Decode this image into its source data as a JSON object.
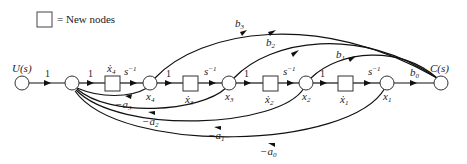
{
  "legend": {
    "symbol": "square-box",
    "text": "= New nodes"
  },
  "nodes": {
    "input": "U(s)",
    "output": "C(s)",
    "x4": "x",
    "x4_sub": "4",
    "x3": "x",
    "x3_sub": "3",
    "x2": "x",
    "x2_sub": "2",
    "x1": "x",
    "x1_sub": "1",
    "x4dot": "ẋ",
    "x4dot_sub": "4",
    "x3dot": "ẋ",
    "x3dot_sub": "3",
    "x2dot": "ẋ",
    "x2dot_sub": "2",
    "x1dot": "ẋ",
    "x1dot_sub": "1"
  },
  "gains": {
    "input_gain": "1",
    "g1": "1",
    "g2": "1",
    "g3": "1",
    "g4": "1",
    "integrator": "s",
    "integrator_exp": "−1"
  },
  "feedforward": {
    "b3": "b",
    "b3_sub": "3",
    "b2": "b",
    "b2_sub": "2",
    "b1": "b",
    "b1_sub": "1",
    "b0": "b",
    "b0_sub": "0"
  },
  "feedback": {
    "a3": "−a",
    "a3_sub": "3",
    "a2": "−a",
    "a2_sub": "2",
    "a1": "−a",
    "a1_sub": "1",
    "a0": "−a",
    "a0_sub": "0"
  }
}
